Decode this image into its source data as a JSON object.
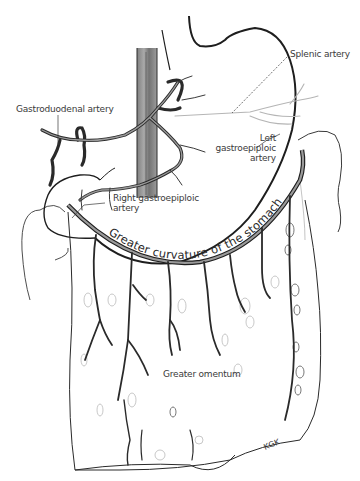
{
  "figure": {
    "labels": {
      "splenic_artery": "Splenic artery",
      "gastroduodenal_artery": "Gastroduodenal artery",
      "left_gastroepiploic_line1": "Left",
      "left_gastroepiploic_line2": "gastroepiploic",
      "left_gastroepiploic_line3": "artery",
      "right_gastroepiploic_line1": "Right gastroepiploic",
      "right_gastroepiploic_line2": "artery",
      "greater_curvature": "Greater curvature of the stomach",
      "greater_omentum": "Greater omentum",
      "signature": "KGK"
    },
    "colors": {
      "ink": "#2a2a2a",
      "vessel_fill": "#8a8a8a",
      "light_sketch": "#b8b8b8",
      "label_text": "#3a3a3a"
    }
  }
}
